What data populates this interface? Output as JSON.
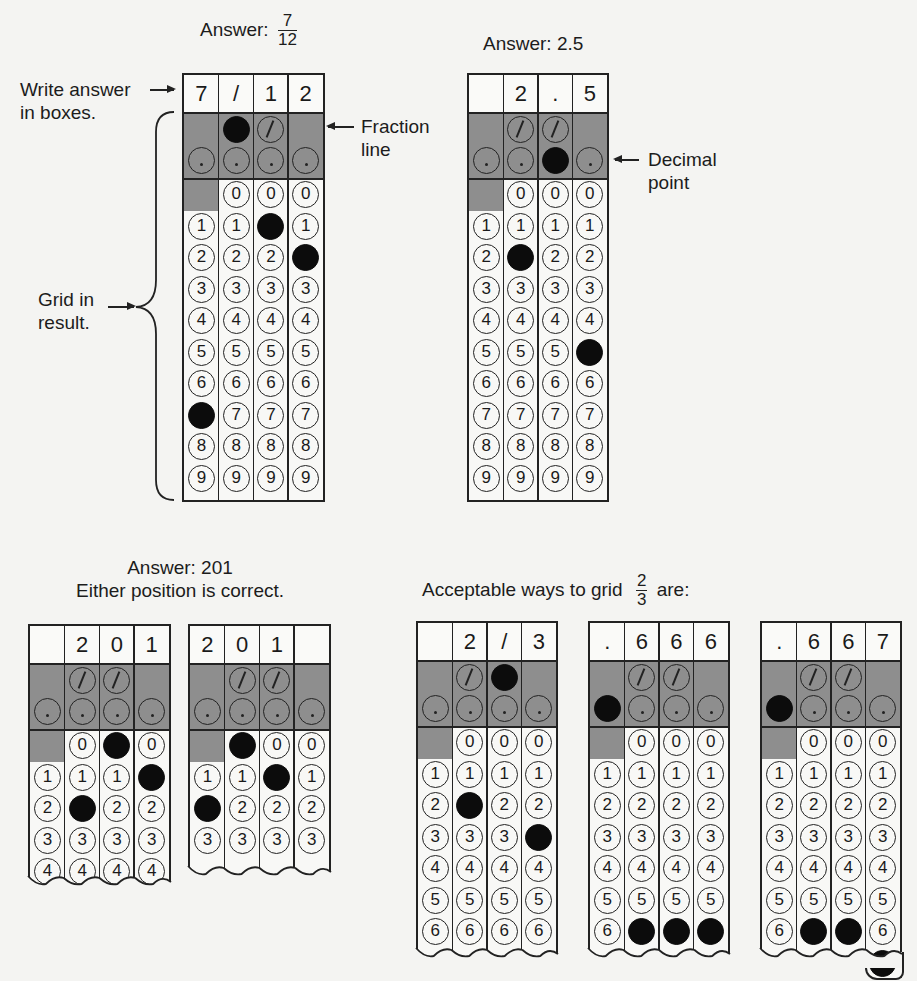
{
  "example_fraction": {
    "answer_label": "Answer:",
    "answer_numerator": "7",
    "answer_denominator": "12",
    "header": [
      "7",
      "/",
      "1",
      "2"
    ],
    "filled": [
      [
        7
      ],
      [
        "/"
      ],
      [
        1
      ],
      [
        2
      ]
    ],
    "callouts": {
      "write_answer_line1": "Write answer",
      "write_answer_line2": "in boxes.",
      "fraction_line_line1": "Fraction",
      "fraction_line_line2": "line",
      "grid_in_line1": "Grid in",
      "grid_in_line2": "result."
    }
  },
  "example_decimal": {
    "answer_label": "Answer: 2.5",
    "header": [
      "",
      "2",
      ".",
      "5"
    ],
    "filled": [
      [],
      [
        2
      ],
      [
        "."
      ],
      [
        5
      ]
    ],
    "callouts": {
      "decimal_point_line1": "Decimal",
      "decimal_point_line2": "point"
    }
  },
  "example_201": {
    "answer_line1": "Answer: 201",
    "answer_line2": "Either position is correct.",
    "grid_a": {
      "header": [
        "",
        "2",
        "0",
        "1"
      ],
      "filled": [
        [],
        [
          2
        ],
        [
          0
        ],
        [
          1
        ]
      ]
    },
    "grid_b": {
      "header": [
        "2",
        "0",
        "1",
        ""
      ],
      "filled": [
        [
          2
        ],
        [
          0
        ],
        [
          1
        ],
        []
      ]
    }
  },
  "example_two_thirds": {
    "caption_prefix": "Acceptable ways to grid",
    "caption_numerator": "2",
    "caption_denominator": "3",
    "caption_suffix": "are:",
    "grid_a": {
      "header": [
        "",
        "2",
        "/",
        "3"
      ],
      "filled": [
        [],
        [
          2
        ],
        [
          "/"
        ],
        [
          3
        ]
      ]
    },
    "grid_b": {
      "header": [
        ".",
        "6",
        "6",
        "6"
      ],
      "filled": [
        [
          "."
        ],
        [
          6
        ],
        [
          6
        ],
        [
          6
        ]
      ]
    },
    "grid_c": {
      "header": [
        ".",
        "6",
        "6",
        "7"
      ],
      "filled": [
        [
          "."
        ],
        [
          6
        ],
        [
          6
        ],
        [
          7
        ]
      ]
    }
  },
  "bubble_symbols": {
    "slash": "/",
    "dot": ".",
    "digits": [
      "0",
      "1",
      "2",
      "3",
      "4",
      "5",
      "6",
      "7",
      "8",
      "9"
    ]
  }
}
